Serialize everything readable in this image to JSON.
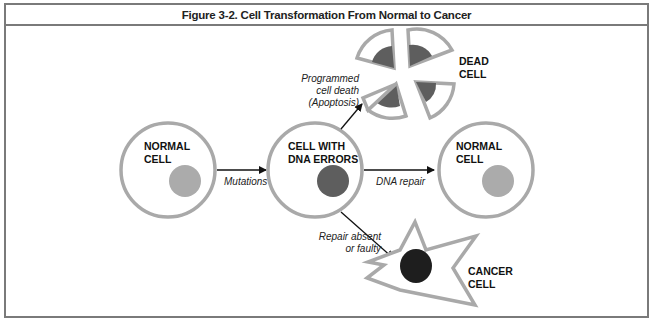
{
  "figure": {
    "title": "Figure 3-2. Cell Transformation From Normal to Cancer"
  },
  "cells": {
    "normal_left": {
      "line1": "NORMAL",
      "line2": "CELL"
    },
    "dna_errors": {
      "line1": "CELL WITH",
      "line2": "DNA ERRORS"
    },
    "normal_right": {
      "line1": "NORMAL",
      "line2": "CELL"
    },
    "dead": {
      "line1": "DEAD",
      "line2": "CELL"
    },
    "cancer": {
      "line1": "CANCER",
      "line2": "CELL"
    }
  },
  "arrows": {
    "mutations": "Mutations",
    "dna_repair": "DNA repair",
    "apoptosis": {
      "line1": "Programmed",
      "line2": "cell death",
      "line3": "(Apoptosis)"
    },
    "repair_absent": {
      "line1": "Repair absent",
      "line2": "or faulty"
    }
  },
  "colors": {
    "membrane": "#a9a9a9",
    "normal_nucleus": "#ababab",
    "error_nucleus": "#5e5e5e",
    "cancer_nucleus": "#1e1e1e",
    "frame": "#7a7a7a",
    "arrow": "#111111"
  }
}
